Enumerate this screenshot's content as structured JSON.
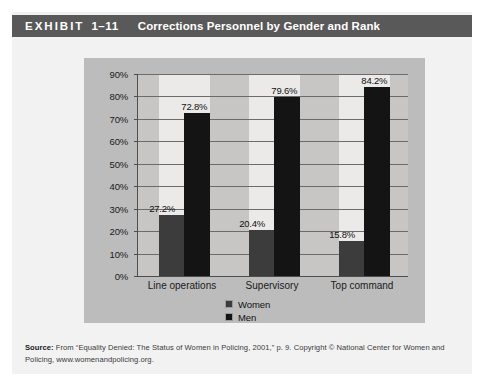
{
  "header": {
    "exhibit_word": "EXHIBIT",
    "exhibit_number": "1–11",
    "title": "Corrections Personnel by Gender and Rank",
    "bar_color": "#595959"
  },
  "chart_data": {
    "type": "bar",
    "title": "Corrections Personnel by Gender and Rank",
    "categories": [
      "Line operations",
      "Supervisory",
      "Top command"
    ],
    "series": [
      {
        "name": "Women",
        "color": "#3c3c3c",
        "values": [
          27.2,
          20.4,
          15.8
        ],
        "labels": [
          "27.2%",
          "20.4%",
          "15.8%"
        ]
      },
      {
        "name": "Men",
        "color": "#141414",
        "values": [
          72.8,
          79.6,
          84.2
        ],
        "labels": [
          "72.8%",
          "79.6%",
          "84.2%"
        ]
      }
    ],
    "xlabel": "",
    "ylabel": "",
    "ylim": [
      0,
      90
    ],
    "ytick_labels": [
      "90%",
      "80%",
      "70%",
      "60%",
      "50%",
      "40%",
      "30%",
      "20%",
      "10%",
      "0%"
    ],
    "ytick_values": [
      90,
      80,
      70,
      60,
      50,
      40,
      30,
      20,
      10,
      0
    ],
    "grid": true,
    "legend_position": "bottom",
    "plot_background": "#eceae8",
    "panel_background": "#bcbcbc"
  },
  "source": {
    "label": "Source:",
    "text": " From “Equality Denied: The Status of Women in Policing, 2001,” p. 9. Copyright © National Center for Women and Policing, www.womenandpolicing.org."
  }
}
